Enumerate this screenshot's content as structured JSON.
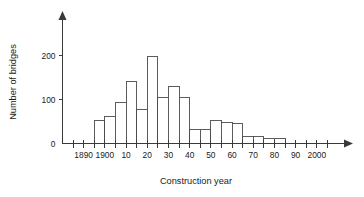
{
  "chart_data": {
    "type": "bar",
    "title": "",
    "subtitle": "",
    "xlabel": "Construction year",
    "ylabel": "Number of bridges",
    "grid": false,
    "legend": null,
    "legend_position": "none",
    "bin_width": 5,
    "xlim": [
      1880,
      2010
    ],
    "ylim": [
      0,
      265
    ],
    "x_tick_labels": [
      "1890",
      "1900",
      "10",
      "20",
      "30",
      "40",
      "50",
      "60",
      "70",
      "80",
      "90",
      "2000"
    ],
    "x_tick_values": [
      1890,
      1900,
      1910,
      1920,
      1930,
      1940,
      1950,
      1960,
      1970,
      1980,
      1990,
      2000
    ],
    "y_tick_labels": [
      "0",
      "100",
      "200"
    ],
    "y_tick_values": [
      0,
      100,
      200
    ],
    "bins": [
      {
        "start": 1895,
        "end": 1900,
        "label": "1895-1900",
        "value": 52
      },
      {
        "start": 1900,
        "end": 1905,
        "label": "1900-1905",
        "value": 62
      },
      {
        "start": 1905,
        "end": 1910,
        "label": "1905-1910",
        "value": 94
      },
      {
        "start": 1910,
        "end": 1915,
        "label": "1910-1915",
        "value": 142
      },
      {
        "start": 1915,
        "end": 1920,
        "label": "1915-1920",
        "value": 78
      },
      {
        "start": 1920,
        "end": 1925,
        "label": "1920-1925",
        "value": 198
      },
      {
        "start": 1925,
        "end": 1930,
        "label": "1925-1930",
        "value": 105
      },
      {
        "start": 1930,
        "end": 1935,
        "label": "1930-1935",
        "value": 130
      },
      {
        "start": 1935,
        "end": 1940,
        "label": "1935-1940",
        "value": 105
      },
      {
        "start": 1940,
        "end": 1945,
        "label": "1940-1945",
        "value": 32
      },
      {
        "start": 1945,
        "end": 1950,
        "label": "1945-1950",
        "value": 32
      },
      {
        "start": 1950,
        "end": 1955,
        "label": "1950-1955",
        "value": 52
      },
      {
        "start": 1955,
        "end": 1960,
        "label": "1955-1960",
        "value": 47
      },
      {
        "start": 1960,
        "end": 1965,
        "label": "1960-1965",
        "value": 45
      },
      {
        "start": 1965,
        "end": 1970,
        "label": "1965-1970",
        "value": 15
      },
      {
        "start": 1970,
        "end": 1975,
        "label": "1970-1975",
        "value": 15
      },
      {
        "start": 1975,
        "end": 1980,
        "label": "1975-1980",
        "value": 12
      },
      {
        "start": 1980,
        "end": 1985,
        "label": "1980-1985",
        "value": 12
      }
    ],
    "categories": [
      "1895-1900",
      "1900-1905",
      "1905-1910",
      "1910-1915",
      "1915-1920",
      "1920-1925",
      "1925-1930",
      "1930-1935",
      "1935-1940",
      "1940-1945",
      "1945-1950",
      "1950-1955",
      "1955-1960",
      "1960-1965",
      "1965-1970",
      "1970-1975",
      "1975-1980",
      "1980-1985"
    ],
    "values": [
      52,
      62,
      94,
      142,
      78,
      198,
      105,
      130,
      105,
      32,
      32,
      52,
      47,
      45,
      15,
      15,
      12,
      12
    ],
    "colors": {
      "bar_fill": "#ffffff",
      "bar_stroke": "#4a4a4a",
      "axis": "#3a3a3a",
      "text": "#1a1a1a",
      "background": "#ffffff"
    }
  }
}
